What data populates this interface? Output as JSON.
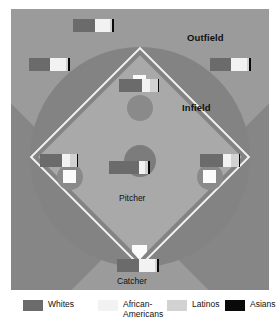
{
  "chart_data": {
    "type": "bar",
    "subtitle": "",
    "xlabel": "",
    "ylabel": "",
    "orientation": "horizontal-stacked",
    "stacked": true,
    "units": "percent",
    "xlim": [
      0,
      100
    ],
    "grid": false,
    "legend_position": "bottom",
    "categories": [
      "Left Field",
      "Center Field",
      "Right Field",
      "Second Base / Shortstop",
      "Third Base",
      "First Base",
      "Pitcher",
      "Catcher"
    ],
    "series": [
      {
        "name": "Whites",
        "color": "#6b6b6b",
        "values": [
          52,
          52,
          52,
          52,
          52,
          52,
          68,
          52
        ]
      },
      {
        "name": "African-Americans",
        "color": "#f2f2f2",
        "values": [
          40,
          40,
          40,
          40,
          40,
          40,
          24,
          40
        ]
      },
      {
        "name": "Latinos",
        "color": "#d2d2d2",
        "values": [
          5,
          5,
          5,
          5,
          5,
          5,
          5,
          5
        ]
      },
      {
        "name": "Asians",
        "color": "#0a0a0a",
        "values": [
          3,
          3,
          3,
          3,
          3,
          3,
          3,
          3
        ]
      }
    ],
    "annotations": [
      "Outfield",
      "Infield",
      "Pitcher",
      "Catcher"
    ]
  },
  "field": {
    "regions": [
      {
        "id": "outfield",
        "label": "Outfield"
      },
      {
        "id": "infield",
        "label": "Infield"
      }
    ],
    "positions": [
      {
        "id": "pitcher",
        "label": "Pitcher"
      },
      {
        "id": "catcher",
        "label": "Catcher"
      }
    ],
    "colors": {
      "outfield_grass": "#9b9b9b",
      "infield_dirt": "#838383",
      "infield_grass": "#a9a9a9",
      "foul_territory": "#868686",
      "base": "#fbfbfb",
      "base_path": "#f2f2f2",
      "mound": "#7c7c7c"
    },
    "bars": [
      {
        "id": "left-field",
        "segments": [
          {
            "group": "Whites",
            "color": "#6b6b6b",
            "width": 21
          },
          {
            "group": "African-Americans",
            "color": "#f2f2f2",
            "width": 16
          },
          {
            "group": "Latinos",
            "color": "#d2d2d2",
            "width": 2
          },
          {
            "group": "Asians",
            "color": "#0a0a0a",
            "width": 2
          }
        ]
      },
      {
        "id": "center-field",
        "segments": [
          {
            "group": "Whites",
            "color": "#6b6b6b",
            "width": 22
          },
          {
            "group": "African-Americans",
            "color": "#f2f2f2",
            "width": 15
          },
          {
            "group": "Latinos",
            "color": "#d2d2d2",
            "width": 2
          },
          {
            "group": "Asians",
            "color": "#0a0a0a",
            "width": 2
          }
        ]
      },
      {
        "id": "right-field",
        "segments": [
          {
            "group": "Whites",
            "color": "#6b6b6b",
            "width": 21
          },
          {
            "group": "African-Americans",
            "color": "#f2f2f2",
            "width": 16
          },
          {
            "group": "Latinos",
            "color": "#d2d2d2",
            "width": 2
          },
          {
            "group": "Asians",
            "color": "#0a0a0a",
            "width": 2
          }
        ]
      },
      {
        "id": "second-base",
        "segments": [
          {
            "group": "Whites",
            "color": "#6b6b6b",
            "width": 23
          },
          {
            "group": "African-Americans",
            "color": "#f2f2f2",
            "width": 8
          },
          {
            "group": "Latinos",
            "color": "#d2d2d2",
            "width": 8
          },
          {
            "group": "Asians",
            "color": "#0a0a0a",
            "width": 1
          }
        ]
      },
      {
        "id": "third-base",
        "segments": [
          {
            "group": "Whites",
            "color": "#6b6b6b",
            "width": 22
          },
          {
            "group": "African-Americans",
            "color": "#f2f2f2",
            "width": 8
          },
          {
            "group": "Latinos",
            "color": "#d2d2d2",
            "width": 7
          },
          {
            "group": "Asians",
            "color": "#0a0a0a",
            "width": 1
          }
        ]
      },
      {
        "id": "first-base",
        "segments": [
          {
            "group": "Whites",
            "color": "#6b6b6b",
            "width": 23
          },
          {
            "group": "African-Americans",
            "color": "#f2f2f2",
            "width": 8
          },
          {
            "group": "Latinos",
            "color": "#d2d2d2",
            "width": 8
          },
          {
            "group": "Asians",
            "color": "#0a0a0a",
            "width": 1
          }
        ]
      },
      {
        "id": "pitcher-bar",
        "segments": [
          {
            "group": "Whites",
            "color": "#6b6b6b",
            "width": 30
          },
          {
            "group": "African-Americans",
            "color": "#f2f2f2",
            "width": 6
          },
          {
            "group": "Latinos",
            "color": "#d2d2d2",
            "width": 3
          },
          {
            "group": "Asians",
            "color": "#0a0a0a",
            "width": 2
          }
        ]
      },
      {
        "id": "catcher-bar",
        "segments": [
          {
            "group": "Whites",
            "color": "#6b6b6b",
            "width": 22
          },
          {
            "group": "African-Americans",
            "color": "#f2f2f2",
            "width": 16
          },
          {
            "group": "Latinos",
            "color": "#d2d2d2",
            "width": 2
          },
          {
            "group": "Asians",
            "color": "#0a0a0a",
            "width": 2
          }
        ]
      }
    ]
  },
  "legend": {
    "items": [
      {
        "label": "Whites",
        "color": "#6b6b6b"
      },
      {
        "label": "African-\nAmericans",
        "color": "#f2f2f2"
      },
      {
        "label": "Latinos",
        "color": "#d2d2d2"
      },
      {
        "label": "Asians",
        "color": "#0a0a0a"
      }
    ]
  }
}
